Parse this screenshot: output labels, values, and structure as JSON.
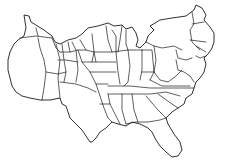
{
  "map": {
    "subject": "United States cartogram",
    "style": "outline",
    "background": "#ffffff",
    "line_color": "#1a1a1a",
    "regions": [
      "west-coast",
      "mountain-west",
      "great-plains",
      "midwest",
      "great-lakes",
      "northeast",
      "mid-atlantic",
      "southeast",
      "south-central",
      "florida"
    ]
  }
}
